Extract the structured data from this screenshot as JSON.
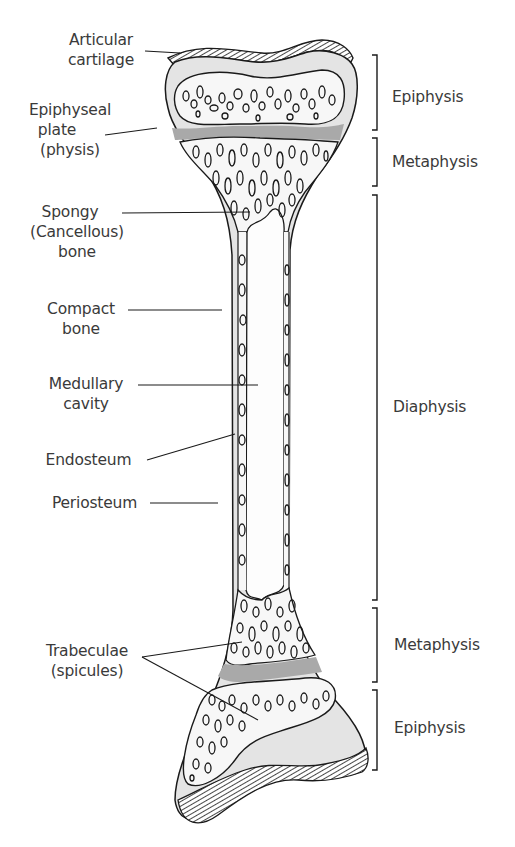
{
  "figure": {
    "colors": {
      "outline": "#1a1a1a",
      "compact_bone": "#e4e4e4",
      "growth_plate": "#a9a9a9",
      "spongy_bone": "#f7f7f7",
      "cavity": "#fdfdfd",
      "text": "#3a3a3a"
    }
  },
  "left_labels": {
    "articular_cartilage": [
      "Articular",
      "cartilage"
    ],
    "epiphyseal_plate": [
      "Epiphyseal",
      "plate",
      "(physis)"
    ],
    "spongy_bone": [
      "Spongy",
      "(Cancellous)",
      "bone"
    ],
    "compact_bone": [
      "Compact",
      "bone"
    ],
    "medullary_cavity": [
      "Medullary",
      "cavity"
    ],
    "endosteum": [
      "Endosteum"
    ],
    "periosteum": [
      "Periosteum"
    ],
    "trabeculae": [
      "Trabeculae",
      "(spicules)"
    ]
  },
  "right_regions": [
    {
      "label": "Epiphysis",
      "top": 55,
      "bottom": 130
    },
    {
      "label": "Metaphysis",
      "top": 138,
      "bottom": 186
    },
    {
      "label": "Diaphysis",
      "top": 195,
      "bottom": 600
    },
    {
      "label": "Metaphysis",
      "top": 608,
      "bottom": 682
    },
    {
      "label": "Epiphysis",
      "top": 690,
      "bottom": 770
    }
  ]
}
